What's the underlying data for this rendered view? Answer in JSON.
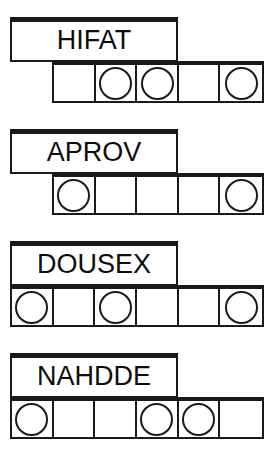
{
  "page": {
    "background_color": "#ffffff",
    "ink_color": "#1a1a1a"
  },
  "groups": [
    {
      "id": "group-1",
      "label": "HIFAT",
      "cell_count": 5,
      "cells": [
        {
          "marker": "empty"
        },
        {
          "marker": "circle"
        },
        {
          "marker": "circle"
        },
        {
          "marker": "empty"
        },
        {
          "marker": "circle"
        }
      ]
    },
    {
      "id": "group-2",
      "label": "APROV",
      "cell_count": 5,
      "cells": [
        {
          "marker": "circle"
        },
        {
          "marker": "empty"
        },
        {
          "marker": "empty"
        },
        {
          "marker": "empty"
        },
        {
          "marker": "circle"
        }
      ]
    },
    {
      "id": "group-3",
      "label": "DOUSEX",
      "cell_count": 6,
      "cells": [
        {
          "marker": "circle"
        },
        {
          "marker": "empty"
        },
        {
          "marker": "circle"
        },
        {
          "marker": "empty"
        },
        {
          "marker": "empty"
        },
        {
          "marker": "circle"
        }
      ]
    },
    {
      "id": "group-4",
      "label": "NAHDDE",
      "cell_count": 6,
      "cells": [
        {
          "marker": "circle"
        },
        {
          "marker": "empty"
        },
        {
          "marker": "empty"
        },
        {
          "marker": "circle"
        },
        {
          "marker": "circle"
        },
        {
          "marker": "empty"
        }
      ]
    }
  ]
}
